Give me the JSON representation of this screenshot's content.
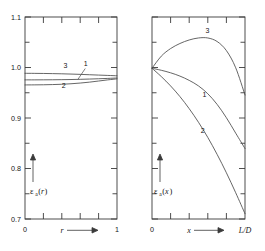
{
  "figure": {
    "background": "#ffffff",
    "line_color": "#4a4a4a",
    "frame_color": "#3a3a3a",
    "text_color": "#161616"
  },
  "chart_data": [
    {
      "id": "left-panel",
      "type": "line",
      "title": "",
      "xlabel": "r",
      "ylabel": "εa(r)",
      "ylabel_symbol": "ε",
      "ylabel_subscript": "a",
      "ylabel_argument": "r",
      "xlim": [
        0,
        1
      ],
      "ylim": [
        0.7,
        1.1
      ],
      "grid": false,
      "legend_position": "inline-curve-labels",
      "y_ticks": [
        0.7,
        0.8,
        0.9,
        1.0,
        1.1
      ],
      "y_tick_labels": [
        "0.7",
        "0.8",
        "0.9",
        "1.0",
        "1.1"
      ],
      "y_minor_ticks": [
        0.75,
        0.85,
        0.95,
        1.05
      ],
      "x_ticks": [
        0,
        1
      ],
      "x_tick_labels": [
        "0",
        "1"
      ],
      "x_minor_ticks": [
        0.2,
        0.4,
        0.6,
        0.8
      ],
      "x_axis_arrow": true,
      "y_axis_arrow": true,
      "series": [
        {
          "name": "3",
          "label": "3",
          "label_x": 0.44,
          "label_y": 1.0,
          "x": [
            0.0,
            0.1,
            0.2,
            0.3,
            0.4,
            0.5,
            0.6,
            0.7,
            0.8,
            0.9,
            1.0
          ],
          "values": [
            0.9885,
            0.9884,
            0.9882,
            0.9879,
            0.9875,
            0.987,
            0.9864,
            0.9857,
            0.985,
            0.9843,
            0.9836
          ]
        },
        {
          "name": "1",
          "label": "1",
          "label_x": 0.66,
          "label_y": 1.002,
          "leader_from_x": 0.655,
          "leader_from_y": 0.998,
          "leader_to_x": 0.575,
          "leader_to_y": 0.9765,
          "x": [
            0.0,
            0.1,
            0.2,
            0.3,
            0.4,
            0.5,
            0.6,
            0.7,
            0.8,
            0.9,
            1.0
          ],
          "values": [
            0.9755,
            0.9755,
            0.9756,
            0.9757,
            0.9759,
            0.9762,
            0.9766,
            0.9771,
            0.9777,
            0.9784,
            0.9792
          ]
        },
        {
          "name": "2",
          "label": "2",
          "label_x": 0.42,
          "label_y": 0.9585,
          "x": [
            0.0,
            0.1,
            0.2,
            0.3,
            0.4,
            0.5,
            0.6,
            0.7,
            0.8,
            0.9,
            1.0
          ],
          "values": [
            0.9655,
            0.9656,
            0.9658,
            0.9662,
            0.9668,
            0.9678,
            0.9692,
            0.971,
            0.9732,
            0.9755,
            0.9775
          ]
        }
      ]
    },
    {
      "id": "right-panel",
      "type": "line",
      "title": "",
      "xlabel": "x",
      "xlabel_right": "L/D",
      "ylabel": "εa(x)",
      "ylabel_symbol": "ε",
      "ylabel_subscript": "a",
      "ylabel_argument": "x",
      "xlim": [
        0,
        1
      ],
      "ylim": [
        0.7,
        1.1
      ],
      "grid": false,
      "legend_position": "inline-curve-labels",
      "y_ticks": [
        0.7,
        0.8,
        0.9,
        1.0,
        1.1
      ],
      "y_tick_labels": [
        "",
        "",
        "",
        "",
        ""
      ],
      "y_minor_ticks": [
        0.75,
        0.85,
        0.95,
        1.05
      ],
      "x_ticks": [
        0,
        1
      ],
      "x_tick_labels": [
        "0",
        "L/D"
      ],
      "x_minor_ticks": [
        0.2,
        0.4,
        0.6,
        0.8
      ],
      "x_axis_arrow": true,
      "y_axis_arrow": true,
      "series": [
        {
          "name": "3",
          "label": "3",
          "label_x": 0.595,
          "label_y": 1.068,
          "x": [
            0.0,
            0.1,
            0.2,
            0.3,
            0.4,
            0.5,
            0.6,
            0.7,
            0.8,
            0.9,
            1.0
          ],
          "values": [
            0.9985,
            1.0225,
            1.0375,
            1.0475,
            1.0545,
            1.0585,
            1.0585,
            1.0515,
            1.0335,
            0.9995,
            0.9455
          ]
        },
        {
          "name": "1",
          "label": "1",
          "label_x": 0.565,
          "label_y": 0.9425,
          "x": [
            0.0,
            0.1,
            0.2,
            0.3,
            0.4,
            0.5,
            0.6,
            0.7,
            0.8,
            0.9,
            1.0
          ],
          "values": [
            0.9985,
            0.9945,
            0.9895,
            0.983,
            0.9745,
            0.9635,
            0.948,
            0.927,
            0.9005,
            0.87,
            0.8395
          ]
        },
        {
          "name": "2",
          "label": "2",
          "label_x": 0.545,
          "label_y": 0.8695,
          "x": [
            0.0,
            0.1,
            0.2,
            0.3,
            0.4,
            0.5,
            0.6,
            0.7,
            0.8,
            0.9,
            1.0
          ],
          "values": [
            0.9985,
            0.982,
            0.9635,
            0.9425,
            0.9185,
            0.8915,
            0.8615,
            0.828,
            0.7915,
            0.752,
            0.7105
          ]
        }
      ]
    }
  ]
}
